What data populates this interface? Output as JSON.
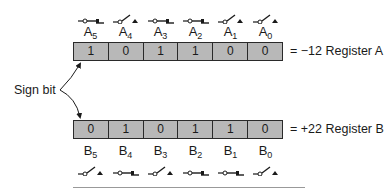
{
  "register_a": {
    "name": "Register A",
    "equation": "= −12 Register A",
    "bits": [
      {
        "label": "A",
        "sub": "5",
        "value": "1",
        "switch": "closed"
      },
      {
        "label": "A",
        "sub": "4",
        "value": "0",
        "switch": "open"
      },
      {
        "label": "A",
        "sub": "3",
        "value": "1",
        "switch": "closed"
      },
      {
        "label": "A",
        "sub": "2",
        "value": "1",
        "switch": "closed"
      },
      {
        "label": "A",
        "sub": "1",
        "value": "0",
        "switch": "open"
      },
      {
        "label": "A",
        "sub": "0",
        "value": "0",
        "switch": "open"
      }
    ]
  },
  "register_b": {
    "name": "Register B",
    "equation": "= +22 Register B",
    "bits": [
      {
        "label": "B",
        "sub": "5",
        "value": "0",
        "switch": "open"
      },
      {
        "label": "B",
        "sub": "4",
        "value": "1",
        "switch": "closed"
      },
      {
        "label": "B",
        "sub": "3",
        "value": "0",
        "switch": "open"
      },
      {
        "label": "B",
        "sub": "2",
        "value": "1",
        "switch": "closed"
      },
      {
        "label": "B",
        "sub": "1",
        "value": "1",
        "switch": "closed"
      },
      {
        "label": "B",
        "sub": "0",
        "value": "0",
        "switch": "open"
      }
    ]
  },
  "annotation": {
    "sign_bit": "Sign bit"
  },
  "colors": {
    "cell_fill": "#b8b8b8",
    "stroke": "#2a2a2a"
  }
}
